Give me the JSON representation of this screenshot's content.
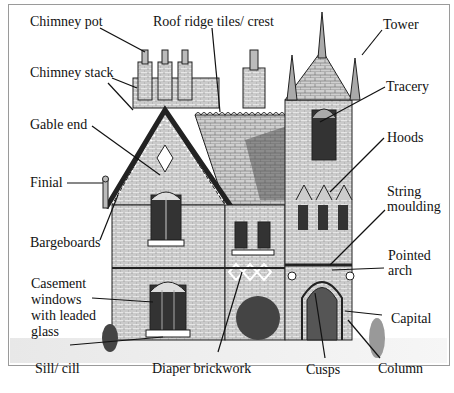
{
  "diagram": {
    "type": "labeled-illustration",
    "labels": [
      {
        "id": "chimney_pot",
        "text": "Chimney pot"
      },
      {
        "id": "roof_ridge",
        "text": "Roof ridge tiles/ crest"
      },
      {
        "id": "tower",
        "text": "Tower"
      },
      {
        "id": "chimney_stack",
        "text": "Chimney stack"
      },
      {
        "id": "tracery",
        "text": "Tracery"
      },
      {
        "id": "gable_end",
        "text": "Gable end"
      },
      {
        "id": "hoods",
        "text": "Hoods"
      },
      {
        "id": "finial",
        "text": "Finial"
      },
      {
        "id": "string_moulding_1",
        "text": "String"
      },
      {
        "id": "string_moulding_2",
        "text": "moulding"
      },
      {
        "id": "bargeboards",
        "text": "Bargeboards"
      },
      {
        "id": "pointed_arch_1",
        "text": "Pointed"
      },
      {
        "id": "pointed_arch_2",
        "text": "arch"
      },
      {
        "id": "casement_1",
        "text": "Casement"
      },
      {
        "id": "casement_2",
        "text": "windows"
      },
      {
        "id": "casement_3",
        "text": "with leaded"
      },
      {
        "id": "casement_4",
        "text": "glass"
      },
      {
        "id": "capital",
        "text": "Capital"
      },
      {
        "id": "sill",
        "text": "Sill/ cill"
      },
      {
        "id": "diaper",
        "text": "Diaper brickwork"
      },
      {
        "id": "cusps",
        "text": "Cusps"
      },
      {
        "id": "column",
        "text": "Column"
      }
    ]
  }
}
